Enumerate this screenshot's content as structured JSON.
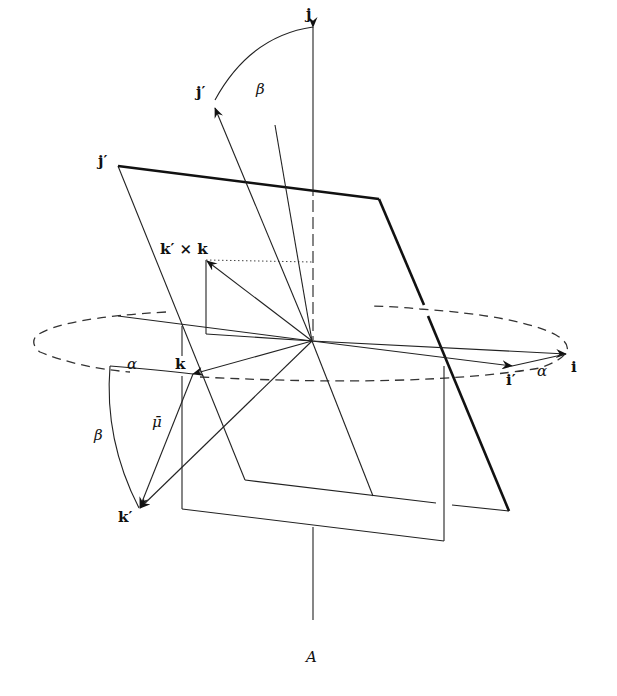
{
  "figure": {
    "caption": "A"
  },
  "labels": {
    "j": "j",
    "j_prime_top": "j′",
    "j_prime_plane": "j′",
    "beta_top": "β",
    "cross": "k′ × k",
    "alpha_left": "α",
    "k": "k",
    "mu": "μ̄",
    "beta_left": "β",
    "k_prime": "k′",
    "i_prime": "i′",
    "alpha_right": "α",
    "i": "i"
  },
  "geometry": {
    "origin": [
      312,
      341
    ],
    "vectors": [
      {
        "name": "j",
        "from": [
          312,
          341
        ],
        "to": [
          313,
          27
        ]
      },
      {
        "name": "j-prime",
        "from": [
          312,
          341
        ],
        "to": [
          215,
          107
        ]
      },
      {
        "name": "i",
        "from": [
          312,
          341
        ],
        "to": [
          566,
          354
        ]
      },
      {
        "name": "i-prime",
        "from": [
          312,
          341
        ],
        "to": [
          512,
          366
        ]
      },
      {
        "name": "k",
        "from": [
          312,
          341
        ],
        "to": [
          193,
          374
        ]
      },
      {
        "name": "k-prime",
        "from": [
          312,
          341
        ],
        "to": [
          139,
          509
        ]
      },
      {
        "name": "k-prime-cross-k",
        "from": [
          312,
          341
        ],
        "to": [
          206,
          260
        ]
      },
      {
        "name": "mu-bar",
        "from": [
          193,
          374
        ],
        "to": [
          139,
          509
        ]
      }
    ],
    "ellipse": {
      "cx": 300,
      "cy": 342,
      "rx": 266,
      "ry": 36
    }
  }
}
